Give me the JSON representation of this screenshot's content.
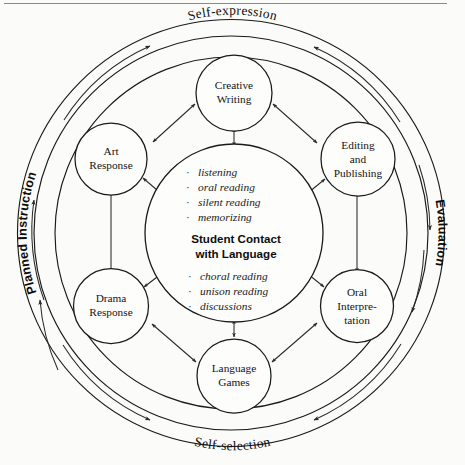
{
  "diagram": {
    "type": "concentric-cycle-diagram",
    "center": {
      "label_line1": "Student Contact",
      "label_line2": "with Language",
      "bullets_top": [
        "listening",
        "oral reading",
        "silent reading",
        "memorizing"
      ],
      "bullets_bottom": [
        "choral reading",
        "unison reading",
        "discussions"
      ],
      "bullet_marker": "·"
    },
    "nodes": [
      {
        "id": "creative-writing",
        "lines": [
          "Creative",
          "Writing"
        ]
      },
      {
        "id": "editing-publishing",
        "lines": [
          "Editing",
          "and",
          "Publishing"
        ]
      },
      {
        "id": "oral-interpretation",
        "lines": [
          "Oral",
          "Interpre-",
          "tation"
        ]
      },
      {
        "id": "language-games",
        "lines": [
          "Language",
          "Games"
        ]
      },
      {
        "id": "drama-response",
        "lines": [
          "Drama",
          "Response"
        ]
      },
      {
        "id": "art-response",
        "lines": [
          "Art",
          "Response"
        ]
      }
    ],
    "ring_labels": {
      "top": "Self-expression",
      "bottom": "Self-selection",
      "left": "Planned Instruction",
      "right": "Evaluation"
    },
    "colors": {
      "stroke": "#1a1a1a",
      "text": "#0d0d0d",
      "background": "#fbfbfa"
    }
  }
}
